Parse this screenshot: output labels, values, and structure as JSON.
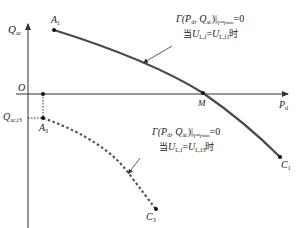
{
  "diagram": {
    "axes": {
      "y_label_main": "Q",
      "y_label_sub": "ac",
      "x_label_main": "P",
      "x_label_sub": "d",
      "origin": "O"
    },
    "points": {
      "A1": {
        "main": "A",
        "sub": "1"
      },
      "A3": {
        "main": "A",
        "sub": "3"
      },
      "M": {
        "main": "M",
        "sub": ""
      },
      "C1": {
        "main": "C",
        "sub": "1"
      },
      "C3": {
        "main": "C",
        "sub": "3"
      }
    },
    "q_tick": {
      "main": "Q",
      "sub": "ac,t3"
    },
    "annotations": [
      {
        "formula": "Γ(P",
        "formula_sub1": "d",
        "formula_mid": ", Q",
        "formula_sub2": "ac",
        "formula_bar": ")|",
        "formula_sub3": "γ=γ",
        "formula_sub3b": "min",
        "formula_end": "=0",
        "cond_prefix": "当",
        "cond_U1": "U",
        "cond_U1_sub": "L,f",
        "cond_eq": "=",
        "cond_U2": "U",
        "cond_U2_sub": "L,f1",
        "cond_suffix": "时",
        "curve_style": "solid"
      },
      {
        "formula": "Γ(P",
        "formula_sub1": "d",
        "formula_mid": ", Q",
        "formula_sub2": "ac",
        "formula_bar": ")|",
        "formula_sub3": "γ=γ",
        "formula_sub3b": "min",
        "formula_end": "=0",
        "cond_prefix": "当",
        "cond_U1": "U",
        "cond_U1_sub": "L,f",
        "cond_eq": "=",
        "cond_U2": "U",
        "cond_U2_sub": "L,f3",
        "cond_suffix": "时",
        "curve_style": "dotted"
      }
    ],
    "colors": {
      "axis": "#333333",
      "solid_curve": "#4a4a4a",
      "dotted_curve": "#555555",
      "text": "#222222"
    }
  }
}
